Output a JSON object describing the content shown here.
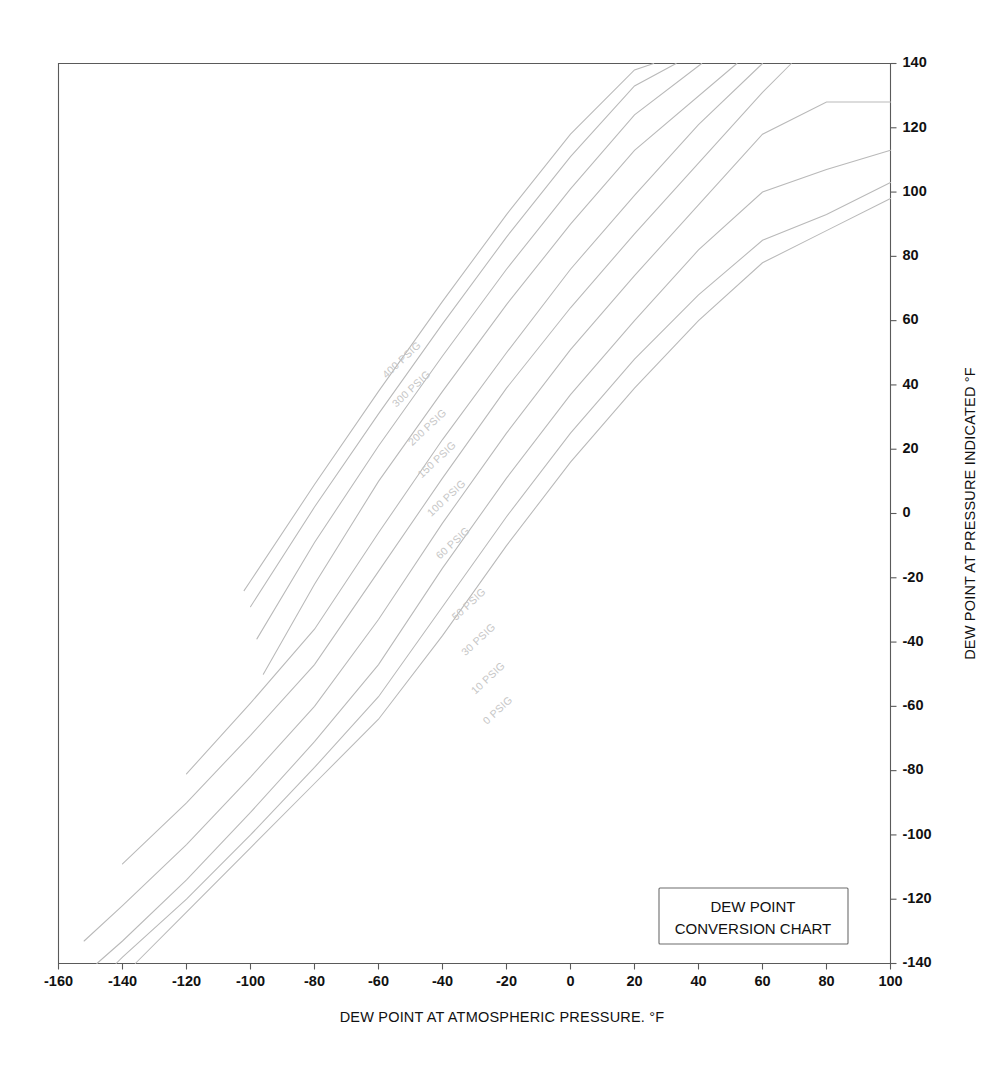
{
  "chart_data": {
    "type": "line",
    "title": "DEW POINT CONVERSION CHART",
    "xlabel": "DEW POINT AT ATMOSPHERIC PRESSURE. °F",
    "ylabel": "DEW POINT AT PRESSURE INDICATED °F",
    "xlim": [
      -160,
      100
    ],
    "ylim": [
      -140,
      140
    ],
    "xticks": [
      -160,
      -140,
      -120,
      -100,
      -80,
      -60,
      -40,
      -20,
      0,
      20,
      40,
      60,
      80,
      100
    ],
    "yticks": [
      -140,
      -120,
      -100,
      -80,
      -60,
      -40,
      -20,
      0,
      20,
      40,
      60,
      80,
      100,
      120,
      140
    ],
    "xtick_labels": [
      "-160",
      "-140",
      "-120",
      "-100",
      "-80",
      "-60",
      "-40",
      "-20",
      "0",
      "20",
      "40",
      "60",
      "80",
      "100"
    ],
    "ytick_labels": [
      "-140",
      "-120",
      "-100",
      "-80",
      "-60",
      "-40",
      "-20",
      "0",
      "20",
      "40",
      "60",
      "80",
      "100",
      "120",
      "140"
    ],
    "grid": false,
    "legend_position": "bottom-right-inside",
    "series": [
      {
        "name": "400 PSIG",
        "label": "400 PSIG",
        "x": [
          -102,
          -100,
          -80,
          -60,
          -40,
          -20,
          0,
          20,
          26
        ],
        "y": [
          -24,
          -21,
          9,
          38,
          66,
          93,
          118,
          138,
          140
        ]
      },
      {
        "name": "300 PSIG",
        "label": "300 PSIG",
        "x": [
          -100,
          -80,
          -60,
          -40,
          -20,
          0,
          20,
          33
        ],
        "y": [
          -29,
          2,
          31,
          59,
          86,
          111,
          133,
          140
        ]
      },
      {
        "name": "200 PSIG",
        "label": "200 PSIG",
        "x": [
          -98,
          -80,
          -60,
          -40,
          -20,
          0,
          20,
          41
        ],
        "y": [
          -39,
          -9,
          21,
          49,
          76,
          101,
          124,
          140
        ]
      },
      {
        "name": "150 PSIG",
        "label": "150 PSIG",
        "x": [
          -96,
          -80,
          -60,
          -40,
          -20,
          0,
          20,
          52
        ],
        "y": [
          -50,
          -22,
          10,
          38,
          65,
          90,
          113,
          140
        ]
      },
      {
        "name": "100 PSIG",
        "label": "100 PSIG",
        "x": [
          -120,
          -100,
          -80,
          -60,
          -40,
          -20,
          0,
          20,
          40,
          60
        ],
        "y": [
          -81,
          -59,
          -36,
          -6,
          23,
          50,
          76,
          99,
          121,
          140
        ]
      },
      {
        "name": "60 PSIG",
        "label": "60 PSIG",
        "x": [
          -140,
          -120,
          -100,
          -80,
          -60,
          -40,
          -20,
          0,
          20,
          40,
          60,
          69
        ],
        "y": [
          -109,
          -90,
          -69,
          -47,
          -18,
          11,
          39,
          64,
          87,
          109,
          131,
          140
        ]
      },
      {
        "name": "50 PSIG",
        "label": "50 PSIG",
        "x": [
          -152,
          -140,
          -120,
          -100,
          -80,
          -60,
          -40,
          -20,
          0,
          20,
          40,
          60,
          80,
          100
        ],
        "y": [
          -133,
          -122,
          -103,
          -82,
          -60,
          -33,
          -3,
          25,
          51,
          74,
          96,
          118,
          128,
          128
        ]
      },
      {
        "name": "30 PSIG",
        "label": "30 PSIG",
        "x": [
          -148,
          -140,
          -120,
          -100,
          -80,
          -60,
          -40,
          -20,
          0,
          20,
          40,
          60,
          80,
          100
        ],
        "y": [
          -140,
          -133,
          -114,
          -93,
          -71,
          -47,
          -17,
          11,
          37,
          60,
          82,
          100,
          107,
          113
        ]
      },
      {
        "name": "10 PSIG",
        "label": "10 PSIG",
        "x": [
          -142,
          -140,
          -120,
          -100,
          -80,
          -60,
          -40,
          -20,
          0,
          20,
          40,
          60,
          80,
          100
        ],
        "y": [
          -140,
          -138,
          -120,
          -100,
          -79,
          -57,
          -29,
          -1,
          25,
          48,
          68,
          85,
          93,
          103
        ]
      },
      {
        "name": "0 PSIG",
        "label": "0 PSIG",
        "x": [
          -136,
          -120,
          -100,
          -80,
          -60,
          -40,
          -20,
          0,
          20,
          40,
          60,
          80,
          100
        ],
        "y": [
          -140,
          -124,
          -104,
          -84,
          -64,
          -38,
          -10,
          16,
          39,
          60,
          78,
          88,
          98
        ]
      }
    ]
  },
  "legend": {
    "line1": "DEW POINT",
    "line2": "CONVERSION CHART"
  }
}
